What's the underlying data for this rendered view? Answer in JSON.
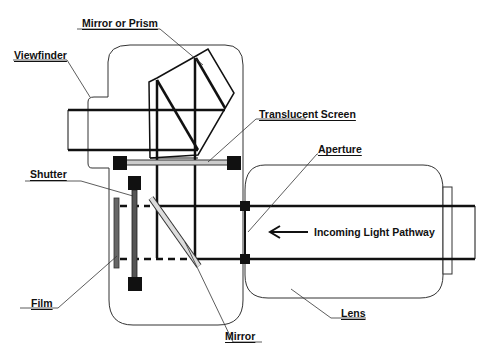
{
  "diagram": {
    "labels": {
      "mirror_or_prism": "Mirror or Prism",
      "viewfinder": "Viewfinder",
      "translucent_screen": "Translucent Screen",
      "aperture": "Aperture",
      "shutter": "Shutter",
      "incoming_light": "Incoming Light Pathway",
      "film": "Film",
      "lens": "Lens",
      "mirror": "Mirror"
    },
    "colors": {
      "line": "#111111",
      "thin_line": "#333333",
      "shutter_fill": "#555555",
      "film_fill": "#666666",
      "mirror_fill": "#dddddd",
      "screen_fill": "#cccccc",
      "background": "#ffffff"
    }
  }
}
